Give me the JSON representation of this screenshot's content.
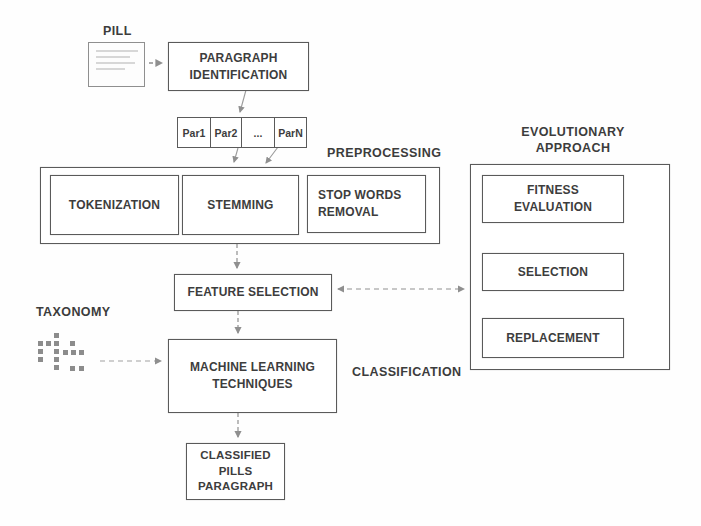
{
  "diagram": {
    "colors": {
      "box_border": "#5a5a5a",
      "text": "#3d3d3d",
      "arrow": "#8f8f8f",
      "taxonomy_dot": "#8c8c8c",
      "background": "#ffffff"
    },
    "pill": {
      "label": "PILL"
    },
    "paragraph_identification": {
      "label": "PARAGRAPH\nIDENTIFICATION"
    },
    "paragraph_cells": [
      "Par1",
      "Par2",
      "...",
      "ParN"
    ],
    "preprocessing": {
      "label": "PREPROCESSING",
      "steps": {
        "tokenization": "TOKENIZATION",
        "stemming": "STEMMING",
        "stop_words": "STOP WORDS\nREMOVAL"
      }
    },
    "feature_selection": {
      "label": "FEATURE SELECTION"
    },
    "evolutionary": {
      "label": "EVOLUTIONARY\nAPPROACH",
      "steps": {
        "fitness": "FITNESS\nEVALUATION",
        "selection": "SELECTION",
        "replacement": "REPLACEMENT"
      }
    },
    "taxonomy": {
      "label": "TAXONOMY",
      "dots": [
        [
          54,
          333
        ],
        [
          38,
          341
        ],
        [
          46,
          341
        ],
        [
          54,
          341
        ],
        [
          70,
          341
        ],
        [
          38,
          349
        ],
        [
          54,
          349
        ],
        [
          63,
          350
        ],
        [
          71,
          350
        ],
        [
          79,
          350
        ],
        [
          38,
          357
        ],
        [
          54,
          357
        ],
        [
          54,
          365
        ],
        [
          70,
          366
        ],
        [
          79,
          366
        ]
      ]
    },
    "classification": {
      "label": "CLASSIFICATION",
      "machine_learning": "MACHINE LEARNING\nTECHNIQUES"
    },
    "classified_output": {
      "label": "CLASSIFIED\nPILLS\nPARAGRAPH"
    }
  }
}
